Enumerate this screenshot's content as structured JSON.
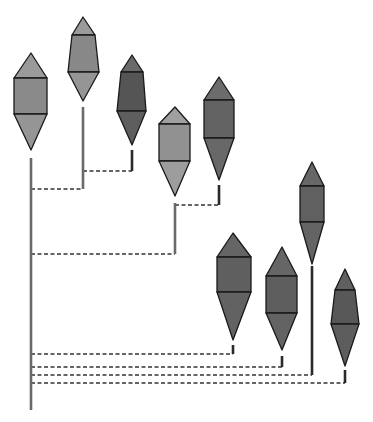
{
  "diagram": {
    "title": "",
    "colors": {
      "outline": "#1a1a1a",
      "stem": "#555555",
      "dash": "#333333",
      "background": "#ffffff"
    },
    "root": {
      "x": 31,
      "y_top": 158,
      "y_bottom": 410
    },
    "nodes": [
      {
        "id": "node-1",
        "cx": 31,
        "apex": 53,
        "top": 78,
        "mid": 114,
        "tip": 150,
        "left": 14,
        "right": 47,
        "top_left": 14,
        "top_right": 47,
        "fill_top": "#9a9a9a",
        "fill_body": "#8a8a8a",
        "fill_bottom": "#959595",
        "stem_top": 158,
        "stem_bottom": 410
      },
      {
        "id": "node-2",
        "cx": 83,
        "apex": 17,
        "top": 35,
        "mid": 72,
        "tip": 101,
        "left": 68,
        "right": 99,
        "top_left": 72,
        "top_right": 95,
        "fill_top": "#9a9a9a",
        "fill_body": "#888888",
        "fill_bottom": "#959595",
        "stem_top": 107,
        "stem_bottom": 189
      },
      {
        "id": "node-3",
        "cx": 132,
        "apex": 55,
        "top": 72,
        "mid": 111,
        "tip": 145,
        "left": 117,
        "right": 146,
        "top_left": 121,
        "top_right": 143,
        "fill_top": "#6a6a6a",
        "fill_body": "#555555",
        "fill_bottom": "#5e5e5e",
        "stem_top": 150,
        "stem_bottom": 171
      },
      {
        "id": "node-4",
        "cx": 175,
        "apex": 107,
        "top": 124,
        "mid": 161,
        "tip": 196,
        "left": 159,
        "right": 190,
        "top_left": 159,
        "top_right": 190,
        "fill_top": "#a0a0a0",
        "fill_body": "#919191",
        "fill_bottom": "#9d9d9d",
        "stem_top": 203,
        "stem_bottom": 254
      },
      {
        "id": "node-5",
        "cx": 219,
        "apex": 77,
        "top": 100,
        "mid": 138,
        "tip": 180,
        "left": 204,
        "right": 234,
        "top_left": 204,
        "top_right": 234,
        "fill_top": "#6c6c6c",
        "fill_body": "#636363",
        "fill_bottom": "#686868",
        "stem_top": 185,
        "stem_bottom": 205
      },
      {
        "id": "node-6",
        "cx": 233,
        "apex": 233,
        "top": 257,
        "mid": 292,
        "tip": 340,
        "left": 217,
        "right": 251,
        "top_left": 217,
        "top_right": 251,
        "fill_top": "#656565",
        "fill_body": "#5f5f5f",
        "fill_bottom": "#626262",
        "stem_top": 345,
        "stem_bottom": 354
      },
      {
        "id": "node-7",
        "cx": 282,
        "apex": 247,
        "top": 276,
        "mid": 313,
        "tip": 350,
        "left": 266,
        "right": 297,
        "top_left": 266,
        "top_right": 297,
        "fill_top": "#666666",
        "fill_body": "#5e5e5e",
        "fill_bottom": "#636363",
        "stem_top": 356,
        "stem_bottom": 367
      },
      {
        "id": "node-8",
        "cx": 312,
        "apex": 162,
        "top": 186,
        "mid": 222,
        "tip": 264,
        "left": 300,
        "right": 324,
        "top_left": 300,
        "top_right": 324,
        "fill_top": "#676767",
        "fill_body": "#606060",
        "fill_bottom": "#646464",
        "stem_top": 266,
        "stem_bottom": 375
      },
      {
        "id": "node-9",
        "cx": 345,
        "apex": 269,
        "top": 290,
        "mid": 324,
        "tip": 366,
        "left": 331,
        "right": 359,
        "top_left": 335,
        "top_right": 355,
        "fill_top": "#606060",
        "fill_body": "#585858",
        "fill_bottom": "#5d5d5d",
        "stem_top": 370,
        "stem_bottom": 383
      }
    ],
    "branches": [
      {
        "id": "branch-1-2",
        "y": 189,
        "x1": 31,
        "x2": 83
      },
      {
        "id": "branch-2-3",
        "y": 171,
        "x1": 83,
        "x2": 132
      },
      {
        "id": "branch-1-4",
        "y": 254,
        "x1": 31,
        "x2": 175
      },
      {
        "id": "branch-4-5",
        "y": 205,
        "x1": 175,
        "x2": 219
      },
      {
        "id": "branch-1-6",
        "y": 354,
        "x1": 31,
        "x2": 233
      },
      {
        "id": "branch-1-7",
        "y": 367,
        "x1": 31,
        "x2": 282
      },
      {
        "id": "branch-1-8",
        "y": 375,
        "x1": 31,
        "x2": 312
      },
      {
        "id": "branch-1-9",
        "y": 383,
        "x1": 31,
        "x2": 345
      }
    ]
  }
}
